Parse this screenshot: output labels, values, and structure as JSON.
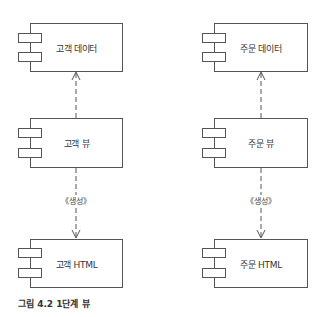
{
  "diagram": {
    "type": "UML component diagram",
    "components": [
      {
        "id": "customer-data",
        "label": "고객 데이터"
      },
      {
        "id": "customer-view",
        "label": "고객 뷰"
      },
      {
        "id": "customer-html",
        "label": "고객 HTML"
      },
      {
        "id": "order-data",
        "label": "주문 데이터"
      },
      {
        "id": "order-view",
        "label": "주문 뷰"
      },
      {
        "id": "order-html",
        "label": "주문 HTML"
      }
    ],
    "dependencies": [
      {
        "from": "customer-view",
        "to": "customer-data",
        "stereotype": ""
      },
      {
        "from": "customer-view",
        "to": "customer-html",
        "stereotype": "«생성»"
      },
      {
        "from": "order-view",
        "to": "order-data",
        "stereotype": ""
      },
      {
        "from": "order-view",
        "to": "order-html",
        "stereotype": "«생성»"
      }
    ],
    "stereotype_label": "《생성》",
    "caption": "그림 4.2 1단계 뷰"
  }
}
